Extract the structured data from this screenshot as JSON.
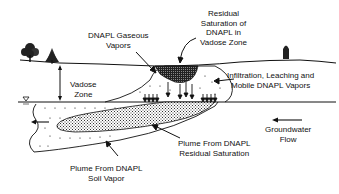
{
  "diagram": {
    "type": "subsurface-contamination-schematic",
    "background": "#ffffff",
    "ink": "#111111",
    "labels": {
      "gaseous_vapors": [
        "DNAPL Gaseous",
        "Vapors"
      ],
      "residual_saturation": [
        "Residual",
        "Saturation of",
        "DNAPL in",
        "Vadose Zone"
      ],
      "vadose_zone": [
        "Vadose",
        "Zone"
      ],
      "infiltration": [
        "Infiltration, Leaching and",
        "Mobile DNAPL Vapors"
      ],
      "plume_residual": [
        "Plume From  DNAPL",
        "Residual Saturation"
      ],
      "groundwater_flow": [
        "Groundwater",
        "Flow"
      ],
      "plume_soil_vapor": [
        "Plume From DNAPL",
        "Soil Vapor"
      ]
    },
    "symbols": {
      "water_table": "water-table-triangle",
      "trees": [
        "deciduous-tree",
        "conifer-tree",
        "distant-tree"
      ]
    }
  }
}
